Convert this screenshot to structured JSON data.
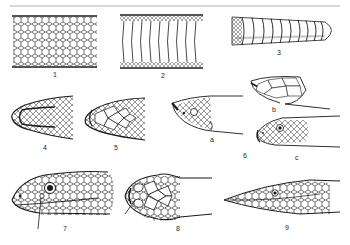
{
  "plate": {
    "subject": "snake scale and head anatomy",
    "rule_color": "#9a9a9a",
    "ink_color": "#1a1a1a",
    "background": "#ffffff"
  },
  "figures": [
    {
      "id": "1",
      "label": "1",
      "depicts": "dorsal body scales (keeled/overlapping net pattern)"
    },
    {
      "id": "2",
      "label": "2",
      "depicts": "ventral plates (wide belly scutes)"
    },
    {
      "id": "3",
      "label": "3",
      "depicts": "rattle segments"
    },
    {
      "id": "4",
      "label": "4",
      "depicts": "head, dorsal view with small granular scales"
    },
    {
      "id": "5",
      "label": "5",
      "depicts": "head, dorsal view with large plates"
    },
    {
      "id": "6",
      "label": "6",
      "depicts": "head comparisons",
      "parts": [
        {
          "id": "6a",
          "label": "a",
          "depicts": "head, lateral, upturned snout"
        },
        {
          "id": "6b",
          "label": "b",
          "depicts": "head, dorsal view with plates"
        },
        {
          "id": "6c",
          "label": "c",
          "depicts": "head, lateral view with round eye"
        }
      ]
    },
    {
      "id": "7",
      "label": "7",
      "depicts": "head, lateral view with loreal pit indicated"
    },
    {
      "id": "8",
      "label": "8",
      "depicts": "head, dorsal view with pointer line"
    },
    {
      "id": "9",
      "label": "9",
      "depicts": "slender head, lateral view"
    }
  ]
}
